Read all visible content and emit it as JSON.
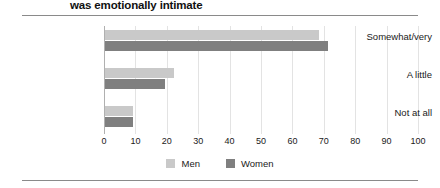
{
  "chart_data": {
    "type": "bar",
    "orientation": "horizontal",
    "title": "was emotionally intimate",
    "xlabel": "",
    "ylabel": "",
    "xlim": [
      0,
      100
    ],
    "xticks": [
      "0",
      "10",
      "20",
      "30",
      "40",
      "50",
      "60",
      "70",
      "80",
      "90",
      "100"
    ],
    "grid": true,
    "legend_position": "bottom",
    "categories": [
      "Somewhat/very",
      "A little",
      "Not at all"
    ],
    "series": [
      {
        "name": "Men",
        "color": "#c9c9c9",
        "values": [
          68,
          22,
          9
        ]
      },
      {
        "name": "Women",
        "color": "#7f7f7f",
        "values": [
          71,
          19,
          9
        ]
      }
    ]
  },
  "legend": {
    "items": [
      {
        "label": "Men",
        "swatch": "legend-swatch-men"
      },
      {
        "label": "Women",
        "swatch": "legend-swatch-women"
      }
    ]
  }
}
